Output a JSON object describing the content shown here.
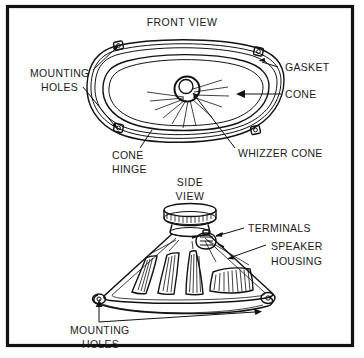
{
  "figure": {
    "kind": "technical-line-drawing",
    "background_color": "#ffffff",
    "ink_color": "#111111",
    "border": {
      "name": "figure-frame",
      "style": "solid rectangle",
      "color": "#111111",
      "thickness_px": 3
    }
  },
  "views": {
    "front": {
      "title": "FRONT VIEW",
      "labels": {
        "mounting_holes_line1": "MOUNTING",
        "mounting_holes_line2": "HOLES",
        "gasket": "GASKET",
        "cone": "CONE",
        "cone_hinge_line1": "CONE",
        "cone_hinge_line2": "HINGE",
        "whizzer_cone": "WHIZZER CONE"
      },
      "parts": [
        "gasket rim",
        "cone",
        "cone hinge",
        "whizzer cone",
        "mounting holes (4 corner tabs)"
      ]
    },
    "side": {
      "title_line1": "SIDE",
      "title_line2": "VIEW",
      "labels": {
        "terminals": "TERMINALS",
        "speaker_housing_line1": "SPEAKER",
        "speaker_housing_line2": "HOUSING",
        "mounting_holes_line1": "MOUNTING",
        "mounting_holes_line2": "HOLES"
      },
      "parts": [
        "magnet assembly",
        "terminals",
        "speaker housing basket with vents",
        "mounting holes (flange tabs)"
      ]
    }
  },
  "icons": {
    "arrow": "arrow-head-icon",
    "mounting_tab": "mounting-tab-icon"
  }
}
